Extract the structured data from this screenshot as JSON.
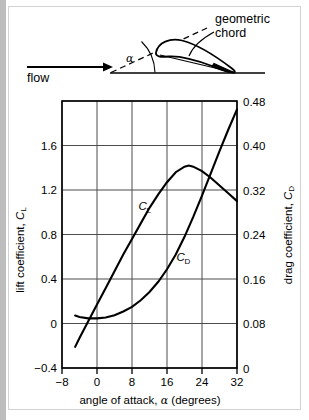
{
  "figure": {
    "background_color": "#ffffff",
    "border_color": "#d2d2d2",
    "line_color": "#000000",
    "grid_color": "#555555"
  },
  "diagram": {
    "name": "airfoil-angle-of-attack-diagram",
    "flow_label": "flow",
    "alpha_symbol": "α",
    "chord_label_line1": "geometric",
    "chord_label_line2": "chord"
  },
  "chart_data": {
    "type": "line",
    "title": "",
    "xlabel": "angle of attack, α (degrees)",
    "ylabel": "lift coefficient, C_L",
    "y2label": "drag coefficient, C_D",
    "xlim": [
      -8,
      32
    ],
    "ylim": [
      -0.4,
      2.0
    ],
    "y2lim": [
      0,
      0.48
    ],
    "xticks": [
      -8,
      0,
      8,
      16,
      24,
      32
    ],
    "xticklabels": [
      "−8",
      "0",
      "8",
      "16",
      "24",
      "32"
    ],
    "yticks": [
      -0.4,
      0,
      0.4,
      0.8,
      1.2,
      1.6,
      2.0
    ],
    "yticklabels": [
      "−0.4",
      "0",
      "0.4",
      "0.8",
      "1.2",
      "1.6",
      ""
    ],
    "y2ticks": [
      0,
      0.08,
      0.16,
      0.24,
      0.32,
      0.4,
      0.48
    ],
    "y2ticklabels": [
      "0",
      "0.08",
      "0.16",
      "0.24",
      "0.32",
      "0.40",
      "0.48"
    ],
    "grid": true,
    "legend": "inline-labels",
    "series": [
      {
        "name": "C_L",
        "label": "C",
        "label_sub": "L",
        "axis": "left",
        "label_x": 9.5,
        "label_y": 1.02,
        "x": [
          -5,
          -4,
          -2,
          0,
          2,
          4,
          6,
          8,
          10,
          12,
          14,
          16,
          18,
          20,
          21,
          22,
          24,
          26,
          28,
          30,
          32
        ],
        "y": [
          -0.21,
          -0.13,
          0.02,
          0.17,
          0.32,
          0.47,
          0.62,
          0.76,
          0.9,
          1.04,
          1.16,
          1.27,
          1.36,
          1.41,
          1.42,
          1.41,
          1.37,
          1.31,
          1.24,
          1.17,
          1.1
        ]
      },
      {
        "name": "C_D",
        "label": "C",
        "label_sub": "D",
        "axis": "right",
        "label_x": 18.2,
        "label_y": 0.135,
        "x": [
          -5,
          -4,
          -2,
          0,
          2,
          4,
          6,
          8,
          10,
          12,
          14,
          16,
          18,
          20,
          22,
          24,
          26,
          28,
          30,
          32
        ],
        "y": [
          0.017,
          0.014,
          0.011,
          0.011,
          0.013,
          0.018,
          0.026,
          0.036,
          0.05,
          0.068,
          0.09,
          0.117,
          0.149,
          0.187,
          0.23,
          0.276,
          0.324,
          0.372,
          0.418,
          0.462
        ]
      }
    ]
  }
}
